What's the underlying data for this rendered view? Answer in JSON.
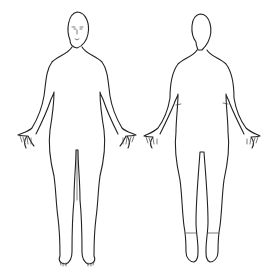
{
  "diagram": {
    "type": "body-outline",
    "figures": [
      {
        "view": "front",
        "center_x": 77
      },
      {
        "view": "back",
        "center_x": 202
      }
    ],
    "colors": {
      "background": "#ffffff",
      "stroke": "#222222"
    }
  }
}
